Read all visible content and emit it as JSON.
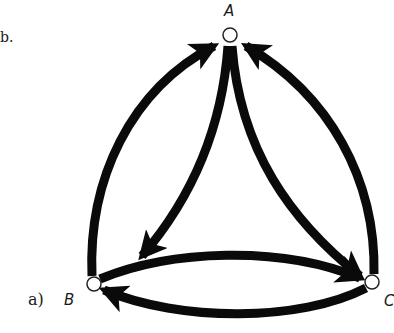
{
  "figure": {
    "part_label": "a)",
    "left_fragment": "b.",
    "colors": {
      "edge": "#0a0a0a",
      "node_fill": "#ffffff",
      "node_stroke": "#222222",
      "background": "#ffffff"
    }
  },
  "nodes": [
    {
      "id": "A",
      "label": "A",
      "x": 230,
      "y": 35
    },
    {
      "id": "B",
      "label": "B",
      "x": 94,
      "y": 284
    },
    {
      "id": "C",
      "label": "C",
      "x": 372,
      "y": 282
    }
  ],
  "edges": [
    {
      "from": "B",
      "to": "A",
      "type": "outer-arc"
    },
    {
      "from": "C",
      "to": "A",
      "type": "outer-arc"
    },
    {
      "from": "A",
      "to": "B",
      "type": "inner-arc"
    },
    {
      "from": "A",
      "to": "C",
      "type": "inner-arc"
    },
    {
      "from": "B",
      "to": "C",
      "type": "upper-arc"
    },
    {
      "from": "C",
      "to": "B",
      "type": "lower-arc"
    }
  ]
}
